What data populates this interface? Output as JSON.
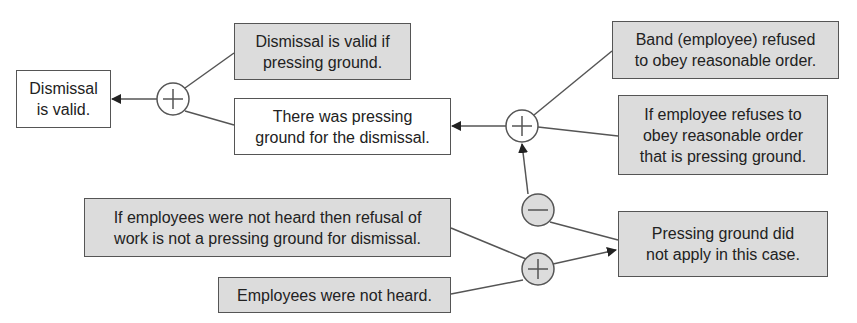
{
  "colors": {
    "gray_fill": "#dcdcdc",
    "white_fill": "#ffffff",
    "stroke": "#555555"
  },
  "nodes": {
    "conclusion": {
      "text": "Dismissal\nis valid.",
      "fill": "white"
    },
    "rule_valid": {
      "text": "Dismissal is valid if\npressing ground.",
      "fill": "gray"
    },
    "pressing_ground": {
      "text": "There was pressing\nground for the dismissal.",
      "fill": "white"
    },
    "band_refused": {
      "text": "Band (employee) refused\nto obey reasonable order.",
      "fill": "gray"
    },
    "rule_refuse": {
      "text": "If employee refuses to\nobey reasonable order\nthat is pressing ground.",
      "fill": "gray"
    },
    "rule_not_heard": {
      "text": "If employees were not heard then refusal of\nwork is not a pressing ground for dismissal.",
      "fill": "gray"
    },
    "not_heard": {
      "text": "Employees were not heard.",
      "fill": "gray"
    },
    "not_apply": {
      "text": "Pressing ground did\nnot apply in this case.",
      "fill": "gray"
    }
  },
  "connectors": {
    "plus_1": {
      "symbol": "plus",
      "fill": "white"
    },
    "plus_2": {
      "symbol": "plus",
      "fill": "white"
    },
    "minus_1": {
      "symbol": "minus",
      "fill": "gray"
    },
    "plus_3": {
      "symbol": "plus",
      "fill": "gray"
    }
  }
}
